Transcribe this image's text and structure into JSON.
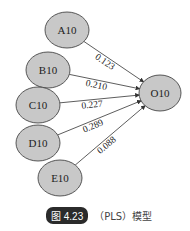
{
  "diagram": {
    "type": "path-model",
    "colors": {
      "node_fill": "#c8c8c8",
      "node_stroke": "#333333",
      "edge": "#333333"
    },
    "nodes": [
      {
        "id": "A10",
        "label": "A10",
        "cx": 67,
        "cy": 30,
        "rx": 22,
        "ry": 18
      },
      {
        "id": "B10",
        "label": "B10",
        "cx": 48,
        "cy": 70,
        "rx": 22,
        "ry": 18
      },
      {
        "id": "C10",
        "label": "C10",
        "cx": 38,
        "cy": 105,
        "rx": 22,
        "ry": 18
      },
      {
        "id": "D10",
        "label": "D10",
        "cx": 38,
        "cy": 143,
        "rx": 22,
        "ry": 18
      },
      {
        "id": "E10",
        "label": "E10",
        "cx": 60,
        "cy": 178,
        "rx": 22,
        "ry": 18
      },
      {
        "id": "O10",
        "label": "O10",
        "cx": 160,
        "cy": 93,
        "rx": 21,
        "ry": 18
      }
    ],
    "edges": [
      {
        "from": "A10",
        "to": "O10",
        "weight": "0.123"
      },
      {
        "from": "B10",
        "to": "O10",
        "weight": "0.210"
      },
      {
        "from": "C10",
        "to": "O10",
        "weight": "0.227"
      },
      {
        "from": "D10",
        "to": "O10",
        "weight": "0.289"
      },
      {
        "from": "E10",
        "to": "O10",
        "weight": "0.088"
      }
    ]
  },
  "caption": {
    "figure_number": "图 4.23",
    "text": "（PLS）模型"
  }
}
